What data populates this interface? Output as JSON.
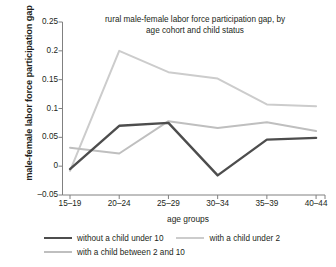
{
  "chart_data": {
    "type": "line",
    "title": "rural male-female labor force participation gap, by age cohort and child status",
    "title_line1": "rural male-female labor force participation gap, by",
    "title_line2": "age cohort and child status",
    "xlabel": "age groups",
    "ylabel": "male-female labor force participation gap",
    "categories": [
      "15–19",
      "20–24",
      "25–29",
      "30–34",
      "35–39",
      "40–44"
    ],
    "ylim": [
      -0.05,
      0.25
    ],
    "yticks": [
      -0.05,
      0,
      0.05,
      0.1,
      0.15,
      0.2,
      0.25
    ],
    "ytick_labels": [
      "–0.05",
      "0",
      "0.05",
      "0.1",
      "0.15",
      "0.2",
      "0.25"
    ],
    "grid": false,
    "legend_position": "bottom",
    "series": [
      {
        "name": "without a child under 10",
        "color": "#4d4d4d",
        "width": 2.4,
        "values": [
          -0.005,
          0.07,
          0.075,
          -0.016,
          0.046,
          0.049
        ]
      },
      {
        "name": "with a child under 2",
        "color": "#cccccc",
        "width": 2.0,
        "values": [
          -0.008,
          0.2,
          0.163,
          0.152,
          0.107,
          0.104
        ]
      },
      {
        "name": "with a child between 2 and 10",
        "color": "#bfbfbf",
        "width": 2.0,
        "values": [
          0.032,
          0.022,
          0.078,
          0.066,
          0.076,
          0.061
        ]
      }
    ]
  },
  "axis": {
    "line_color": "#808080"
  }
}
